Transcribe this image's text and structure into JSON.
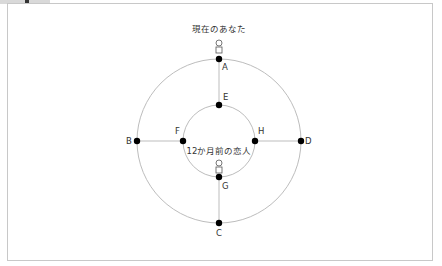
{
  "diagram": {
    "top_label": "現在のあなた",
    "center_label": "12か月前の恋人",
    "points": {
      "A": "A",
      "B": "B",
      "C": "C",
      "D": "D",
      "E": "E",
      "F": "F",
      "G": "G",
      "H": "H"
    },
    "colors": {
      "line": "#bdbdbd",
      "dot": "#000000",
      "text": "#333333",
      "frame": "#c8c8c8"
    }
  }
}
